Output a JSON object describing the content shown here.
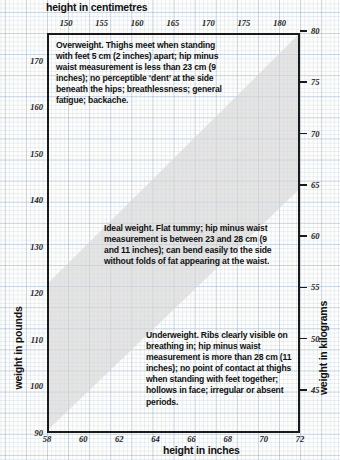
{
  "chart_data": {
    "type": "area",
    "title": "",
    "xlabel": "height in inches",
    "xlabel_secondary": "height in centimetres",
    "ylabel": "weight in pounds",
    "ylabel_secondary": "weight in kilograms",
    "grid": true,
    "legend": "none",
    "xlim": [
      58,
      72
    ],
    "ylim": [
      90,
      176
    ],
    "xlim_cm": [
      147.32,
      182.88
    ],
    "ylim_kg": [
      40.8,
      79.8
    ],
    "xticks": [
      58,
      60,
      62,
      64,
      66,
      68,
      70,
      72
    ],
    "xticklabels": [
      "58",
      "60",
      "62",
      "64",
      "66",
      "68",
      "70",
      "72"
    ],
    "xticks_top_cm": [
      150,
      155,
      160,
      165,
      170,
      175,
      180
    ],
    "xticklabels_top_cm": [
      "150",
      "155",
      "160",
      "165",
      "170",
      "175",
      "180"
    ],
    "yticks": [
      90,
      100,
      110,
      120,
      130,
      140,
      150,
      160,
      170
    ],
    "yticklabels": [
      "90",
      "100",
      "110",
      "120",
      "130",
      "140",
      "150",
      "160",
      "170"
    ],
    "yticks_right_kg": [
      45,
      50,
      55,
      60,
      65,
      70,
      75,
      80
    ],
    "yticklabels_right_kg": [
      "45",
      "50",
      "55",
      "60",
      "65",
      "70",
      "75",
      "80"
    ],
    "series": [
      {
        "name": "ideal weight band",
        "fill": "#d5d5d5",
        "upper_bound": {
          "x": [
            58,
            72
          ],
          "y": [
            122,
            176
          ]
        },
        "lower_bound": {
          "x": [
            58,
            72
          ],
          "y": [
            90,
            142
          ]
        }
      }
    ],
    "regions": [
      {
        "name": "overweight",
        "position": "above-band"
      },
      {
        "name": "ideal",
        "position": "inside-band"
      },
      {
        "name": "underweight",
        "position": "below-band"
      }
    ]
  },
  "axes": {
    "top_title": "height in centimetres",
    "bottom_title": "height in inches",
    "left_title": "weight in pounds",
    "right_title": "weight in kilograms"
  },
  "notes": {
    "overweight": "Overweight. Thighs meet when standing with feet 5 cm (2 inches) apart; hip minus waist measurement is less than 23 cm (9 inches); no perceptible ‘dent’ at the side beneath the hips; breathlessness; general fatigue; backache.",
    "ideal": "Ideal weight. Flat tummy; hip minus waist measurement is between 23 and 28 cm (9 and 11 inches); can bend easily to the side without folds of fat appearing at the waist.",
    "underweight": "Underweight. Ribs clearly visible on breathing in; hip minus waist measurement is more than 28 cm (11 inches); no point of contact at thighs when standing with feet together; hollows in face; irregular or absent periods."
  },
  "colors": {
    "band": "#d5d5d5",
    "frame": "#1a1a1a",
    "grid": "#7896b9",
    "paper": "#fdfdfb",
    "text": "#111111"
  }
}
